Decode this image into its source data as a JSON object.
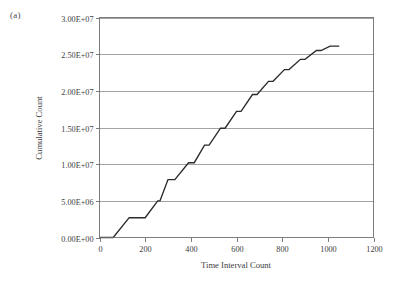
{
  "figure": {
    "panel_label": "(a)",
    "background_color": "#ffffff"
  },
  "chart_data": {
    "type": "line",
    "title": "",
    "subtitle": "",
    "xlabel": "Time Interval Count",
    "ylabel": "Cumulative Count",
    "xlim": [
      0,
      1200
    ],
    "ylim": [
      0,
      30000000
    ],
    "xticks": [
      0,
      200,
      400,
      600,
      800,
      1000,
      1200
    ],
    "xtick_labels": [
      "0",
      "200",
      "400",
      "600",
      "800",
      "1000",
      "1200"
    ],
    "yticks": [
      0,
      5000000,
      10000000,
      15000000,
      20000000,
      25000000,
      30000000
    ],
    "ytick_labels": [
      "0.00E+00",
      "5.00E+06",
      "1.00E+07",
      "1.50E+07",
      "2.00E+07",
      "2.50E+07",
      "3.00E+07"
    ],
    "grid": "horizontal",
    "legend": "none",
    "annotations": [],
    "line_color": "#2b2b2b",
    "grid_color": "#8c8c8c",
    "series": [
      {
        "name": "Cumulative Count",
        "style": "step-staircase",
        "x": [
          0,
          60,
          130,
          200,
          255,
          265,
          300,
          330,
          390,
          415,
          460,
          480,
          530,
          550,
          600,
          620,
          670,
          690,
          740,
          760,
          810,
          830,
          880,
          900,
          950,
          970,
          1010,
          1050
        ],
        "y": [
          0,
          0,
          2700000,
          2700000,
          5000000,
          5000000,
          7900000,
          7900000,
          10200000,
          10200000,
          12600000,
          12600000,
          14900000,
          14900000,
          17200000,
          17200000,
          19500000,
          19500000,
          21300000,
          21300000,
          22900000,
          22900000,
          24300000,
          24300000,
          25500000,
          25500000,
          26100000,
          26100000
        ]
      }
    ]
  }
}
